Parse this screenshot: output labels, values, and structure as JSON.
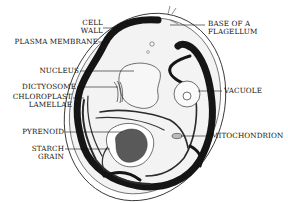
{
  "diagram": {
    "labels_left": [
      {
        "id": "cell-wall",
        "lines": [
          "CELL",
          "WALL"
        ]
      },
      {
        "id": "plasma-membrane",
        "lines": [
          "PLASMA MEMBRANE"
        ]
      },
      {
        "id": "nucleus",
        "lines": [
          "NUCLEUS"
        ]
      },
      {
        "id": "dictyosome",
        "lines": [
          "DICTYOSOME"
        ]
      },
      {
        "id": "chloroplast-lamellae",
        "lines": [
          "CHLOROPLAST",
          "LAMELLAE"
        ]
      },
      {
        "id": "pyrenoid",
        "lines": [
          "PYRENOID"
        ]
      },
      {
        "id": "starch-grain",
        "lines": [
          "STARCH",
          "GRAIN"
        ]
      }
    ],
    "labels_right": [
      {
        "id": "base-of-flagellum",
        "lines": [
          "BASE OF A",
          "FLAGELLUM"
        ]
      },
      {
        "id": "vacuole",
        "lines": [
          "VACUOLE"
        ]
      },
      {
        "id": "mitochondrion",
        "lines": [
          "MITOCHONDRION"
        ]
      }
    ],
    "colors": {
      "ink": "#111111",
      "chloroplast": "#1a1a1a",
      "pyrenoid": "#5a5a5a",
      "cytoplasm": "#f2f2f2",
      "background": "#ffffff"
    }
  }
}
